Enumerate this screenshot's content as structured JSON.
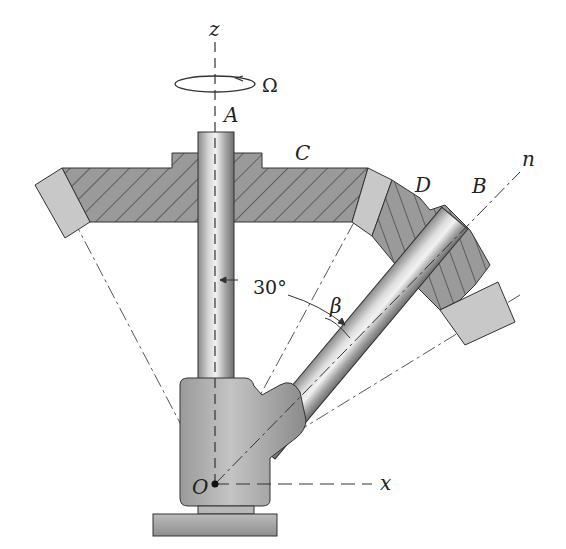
{
  "figure": {
    "type": "mechanical-diagram"
  },
  "labels": {
    "z_axis": "z",
    "x_axis": "x",
    "n_axis": "n",
    "omega": "Ω",
    "point_A": "A",
    "point_B": "B",
    "gear_C": "C",
    "gear_D": "D",
    "origin_O": "O",
    "angle_30": "30°",
    "angle_beta": "β"
  },
  "colors": {
    "background": "#ffffff",
    "gear_fill": "#9a9a9a",
    "gear_tooth_fill": "#c8c8c8",
    "hatch": "#333333",
    "shaft_dark": "#7d7d7d",
    "shaft_light": "#e6e6e6",
    "line": "#333333"
  }
}
